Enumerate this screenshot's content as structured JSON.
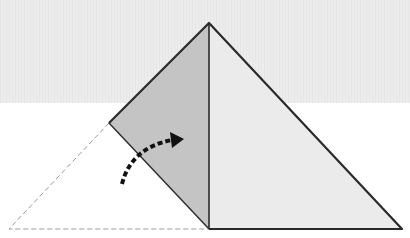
{
  "diagram": {
    "kind": "origami-fold-step",
    "colors": {
      "background_band": "#ececec",
      "paper_front": "#ebebeb",
      "paper_folded": "#c4c4c4",
      "outline": "#2a2a2a",
      "dashed_outline": "#9a9a9a",
      "arrow": "#111111"
    },
    "elements": {
      "folded_flap": "shaded left flap (folded layer)",
      "right_face": "light right face of triangle",
      "original_position": "dashed outline of the corner before folding",
      "fold_arrow": "dashed curved arrow indicating fold direction"
    }
  }
}
